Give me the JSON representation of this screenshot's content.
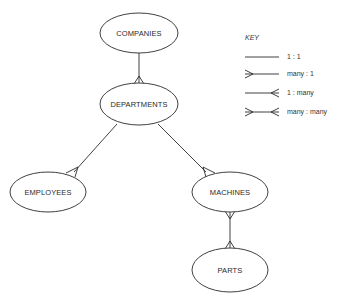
{
  "diagram": {
    "type": "entity-relationship",
    "entities": [
      {
        "id": "companies",
        "label": "COMPANIES",
        "cx": 139,
        "cy": 33,
        "rx": 39,
        "ry": 20
      },
      {
        "id": "departments",
        "label": "DEPARTMENTS",
        "cx": 139,
        "cy": 104,
        "rx": 39,
        "ry": 21
      },
      {
        "id": "employees",
        "label": "EMPLOYEES",
        "cx": 48,
        "cy": 192,
        "rx": 38,
        "ry": 20
      },
      {
        "id": "machines",
        "label": "MACHINES",
        "cx": 230,
        "cy": 192,
        "rx": 38,
        "ry": 20
      },
      {
        "id": "parts",
        "label": "PARTS",
        "cx": 230,
        "cy": 270,
        "rx": 38,
        "ry": 22
      }
    ],
    "relationships": [
      {
        "from": "companies",
        "to": "departments",
        "type": "1 : many"
      },
      {
        "from": "departments",
        "to": "employees",
        "type": "1 : many"
      },
      {
        "from": "departments",
        "to": "machines",
        "type": "1 : many"
      },
      {
        "from": "machines",
        "to": "parts",
        "type": "many : many"
      }
    ]
  },
  "key": {
    "title": "KEY",
    "items": [
      {
        "symbol": "plain-line",
        "label": "1 : 1"
      },
      {
        "symbol": "crowfoot-left",
        "label": "many : 1"
      },
      {
        "symbol": "crowfoot-right",
        "label": "1 : many"
      },
      {
        "symbol": "crowfoot-both",
        "label": "many : many"
      }
    ]
  }
}
